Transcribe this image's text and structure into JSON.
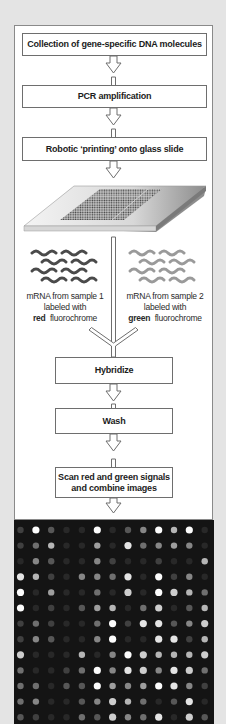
{
  "diagram": {
    "steps": [
      {
        "id": "collection",
        "label": "Collection of gene-specific DNA molecules"
      },
      {
        "id": "pcr",
        "label": "PCR amplification"
      },
      {
        "id": "printing",
        "label": "Robotic ‘printing’ onto glass slide"
      },
      {
        "id": "hybridize",
        "label": "Hybridize"
      },
      {
        "id": "wash",
        "label": "Wash"
      },
      {
        "id": "scan",
        "label_line1": "Scan red and green signals",
        "label_line2": "and combine images"
      }
    ],
    "samples": [
      {
        "id": "sample1",
        "line1": "mRNA from sample 1",
        "line2": "labeled with",
        "color_word": "red",
        "line3_rest": "fluorochrome",
        "strand_color": "#4a4a4a"
      },
      {
        "id": "sample2",
        "line1": "mRNA from sample 2",
        "line2": "labeled with",
        "color_word": "green",
        "line3_rest": "fluorochrome",
        "strand_color": "#9a9a9a"
      }
    ],
    "glass_slide": {
      "description": "Glass slide with printed spot grid (two blocks)"
    },
    "microarray_image": {
      "description": "Scanned microarray image, bright spots on black",
      "columns": 13,
      "rows": 13,
      "intensities": [
        [
          1,
          9,
          2,
          0,
          0,
          9,
          0,
          2,
          4,
          9,
          6,
          9,
          0
        ],
        [
          1,
          3,
          6,
          0,
          0,
          5,
          0,
          8,
          3,
          4,
          5,
          4,
          0
        ],
        [
          0,
          4,
          2,
          0,
          0,
          4,
          1,
          0,
          0,
          1,
          0,
          0,
          6
        ],
        [
          8,
          6,
          1,
          0,
          4,
          4,
          3,
          8,
          0,
          9,
          1,
          4,
          0
        ],
        [
          9,
          0,
          5,
          0,
          0,
          3,
          0,
          7,
          0,
          9,
          7,
          6,
          3
        ],
        [
          9,
          0,
          1,
          0,
          2,
          5,
          6,
          0,
          3,
          7,
          0,
          2,
          6
        ],
        [
          1,
          3,
          1,
          0,
          0,
          3,
          9,
          1,
          8,
          8,
          2,
          4,
          7
        ],
        [
          1,
          4,
          2,
          0,
          0,
          4,
          9,
          0,
          0,
          8,
          8,
          1,
          6
        ],
        [
          7,
          0,
          0,
          0,
          6,
          0,
          4,
          9,
          7,
          6,
          6,
          6,
          7
        ],
        [
          3,
          0,
          0,
          1,
          3,
          9,
          4,
          8,
          7,
          4,
          8,
          7,
          3
        ],
        [
          3,
          3,
          0,
          2,
          2,
          9,
          5,
          4,
          5,
          9,
          8,
          4,
          1
        ],
        [
          3,
          4,
          0,
          0,
          2,
          4,
          7,
          6,
          3,
          0,
          2,
          8,
          0
        ],
        [
          2,
          1,
          0,
          0,
          3,
          2,
          7,
          4,
          3,
          8,
          0,
          7,
          2
        ]
      ]
    }
  }
}
